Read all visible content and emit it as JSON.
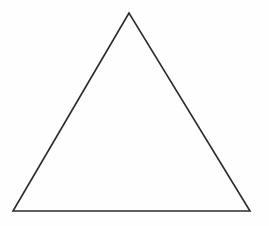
{
  "figure": {
    "name": "triangle-line-drawing",
    "shape_label": "triangle",
    "canvas": {
      "width": 269,
      "height": 226,
      "background_color": "#fefefe"
    },
    "stroke": {
      "color": "#2b2b2b",
      "width": 1.6,
      "linejoin": "miter",
      "linecap": "butt",
      "fill": "none"
    },
    "vertices": [
      {
        "name": "apex",
        "x": 129,
        "y": 13
      },
      {
        "name": "bottom-left",
        "x": 13,
        "y": 211
      },
      {
        "name": "bottom-right",
        "x": 250,
        "y": 211
      }
    ],
    "edges": [
      {
        "name": "left-edge",
        "from": "apex",
        "to": "bottom-left"
      },
      {
        "name": "bottom-edge",
        "from": "bottom-left",
        "to": "bottom-right"
      },
      {
        "name": "right-edge",
        "from": "bottom-right",
        "to": "apex"
      }
    ],
    "points_attribute": "129,13 13,211 250,211",
    "labels": []
  }
}
